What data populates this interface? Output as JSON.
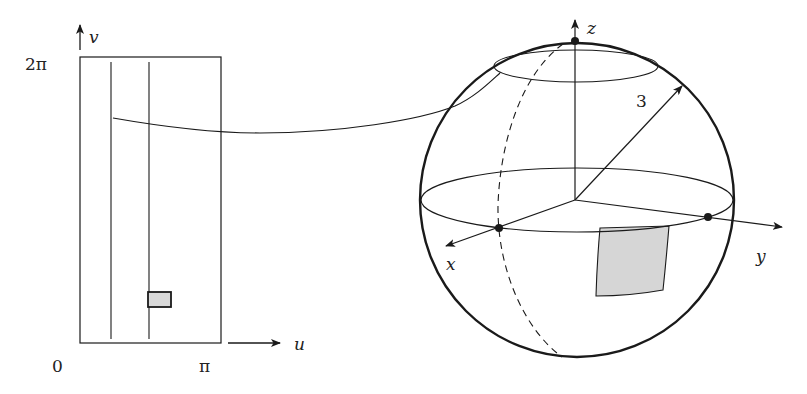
{
  "parameter_domain": {
    "axis_u_label": "u",
    "axis_v_label": "v",
    "tick_origin": "0",
    "tick_u_max": "π",
    "tick_v_max": "2π",
    "rectangle": {
      "u_range": "[0, π]",
      "v_range": "[0, 2π]"
    },
    "vertical_lines": 2,
    "small_patch_fill": "#d9d9d9"
  },
  "sphere": {
    "radius_label": "3",
    "axis_x_label": "x",
    "axis_y_label": "y",
    "axis_z_label": "z",
    "marked_points": [
      "north-pole",
      "x-axis-intersection",
      "y-axis-intersection"
    ],
    "patch_fill": "#d6d6d6",
    "meridian_style": "dashed",
    "latitude_circles": [
      "equator",
      "upper-latitude"
    ]
  },
  "mapping_curve": "connects a horizontal line in the uv-rectangle to the upper latitude circle on the sphere",
  "colors": {
    "stroke": "#1a1a1a",
    "background": "#ffffff",
    "patch": "#d6d6d6"
  }
}
